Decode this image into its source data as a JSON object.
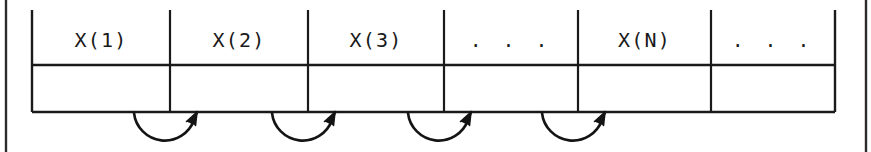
{
  "figure": {
    "kind": "array-cell-diagram",
    "ink_color": "#1a1a1a",
    "background_color": "#ffffff",
    "width": 871,
    "height": 152
  },
  "table": {
    "left": 32,
    "right": 835,
    "mid_rule_y": 65,
    "bottom_rule_y": 112,
    "top_y": 10,
    "column_boundaries": [
      32,
      170,
      308,
      444,
      578,
      711,
      835
    ],
    "columns": [
      {
        "label": "X(1)",
        "is_ellipsis": false
      },
      {
        "label": "X(2)",
        "is_ellipsis": false
      },
      {
        "label": "X(3)",
        "is_ellipsis": false
      },
      {
        "label": ". . .",
        "is_ellipsis": true
      },
      {
        "label": "X(N)",
        "is_ellipsis": false
      },
      {
        "label": ". . .",
        "is_ellipsis": true
      }
    ]
  },
  "arrows": [
    {
      "name": "arrow-1",
      "from_x": 134,
      "to_x": 196,
      "dip": 36
    },
    {
      "name": "arrow-2",
      "from_x": 272,
      "to_x": 334,
      "dip": 36
    },
    {
      "name": "arrow-3",
      "from_x": 408,
      "to_x": 470,
      "dip": 36
    },
    {
      "name": "arrow-4",
      "from_x": 542,
      "to_x": 604,
      "dip": 36
    }
  ],
  "margins": [
    {
      "name": "left-margin-rule",
      "x": 6
    },
    {
      "name": "right-margin-rule",
      "x": 866
    }
  ]
}
